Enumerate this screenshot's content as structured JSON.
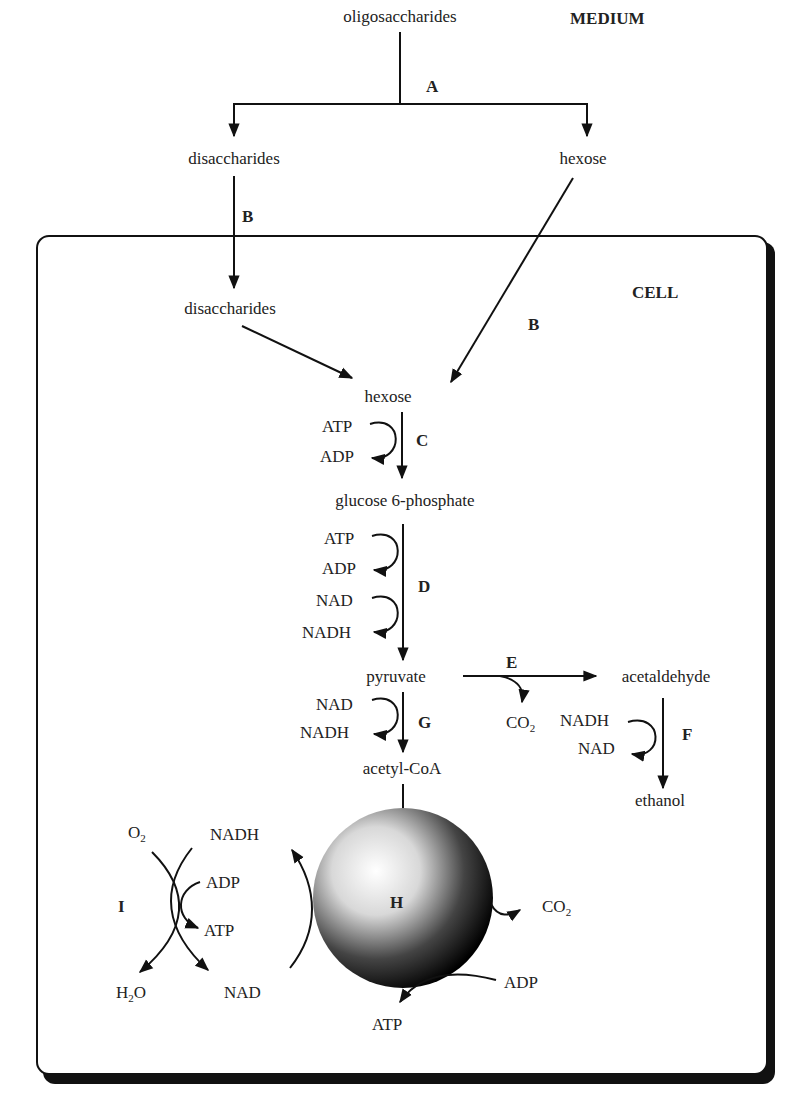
{
  "regions": {
    "medium": "MEDIUM",
    "cell": "CELL"
  },
  "medium": {
    "oligosaccharides": "oligosaccharides",
    "disaccharides": "disaccharides",
    "hexose": "hexose"
  },
  "cell": {
    "disaccharides": "disaccharides",
    "hexose": "hexose",
    "glucose6p": "glucose 6-phosphate",
    "pyruvate": "pyruvate",
    "acetaldehyde": "acetaldehyde",
    "ethanol": "ethanol",
    "acetylcoa": "acetyl-CoA"
  },
  "steps": {
    "A": "A",
    "B1": "B",
    "B2": "B",
    "C": "C",
    "D": "D",
    "E": "E",
    "F": "F",
    "G": "G",
    "H": "H",
    "I": "I"
  },
  "cofactors": {
    "c_atp": "ATP",
    "c_adp": "ADP",
    "d_atp": "ATP",
    "d_adp": "ADP",
    "d_nad": "NAD",
    "d_nadh": "NADH",
    "e_co2": "CO",
    "e_co2_sub": "2",
    "f_nadh": "NADH",
    "f_nad": "NAD",
    "g_nad": "NAD",
    "g_nadh": "NADH",
    "h_co2": "CO",
    "h_co2_sub": "2",
    "h_adp": "ADP",
    "h_atp": "ATP",
    "i_o2": "O",
    "i_o2_sub": "2",
    "i_nadh": "NADH",
    "i_adp": "ADP",
    "i_atp": "ATP",
    "i_h2o_h": "H",
    "i_h2o_sub": "2",
    "i_h2o_o": "O",
    "i_nad": "NAD"
  }
}
